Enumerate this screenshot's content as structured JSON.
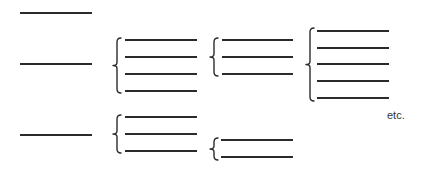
{
  "diagram": {
    "colors": {
      "line": "#2b2b2b",
      "background": "#ffffff",
      "text": "#333333"
    },
    "singles": [
      {
        "id": "single-1",
        "x1": 20,
        "x2": 92,
        "y": 13
      },
      {
        "id": "single-2",
        "x1": 20,
        "x2": 92,
        "y": 64
      },
      {
        "id": "single-3",
        "x1": 20,
        "x2": 92,
        "y": 135
      }
    ],
    "groups": [
      {
        "id": "group-a",
        "count": 4,
        "x1": 125,
        "x2": 197,
        "ys": [
          40,
          57,
          74,
          91
        ],
        "brace": {
          "x": 117,
          "y1": 38,
          "y2": 93
        }
      },
      {
        "id": "group-b",
        "count": 3,
        "x1": 125,
        "x2": 197,
        "ys": [
          117,
          134,
          151
        ],
        "brace": {
          "x": 117,
          "y1": 115,
          "y2": 153
        }
      },
      {
        "id": "group-c",
        "count": 3,
        "x1": 222,
        "x2": 293,
        "ys": [
          40,
          57,
          74
        ],
        "brace": {
          "x": 214,
          "y1": 38,
          "y2": 76
        }
      },
      {
        "id": "group-d",
        "count": 5,
        "x1": 317,
        "x2": 389,
        "ys": [
          31,
          48,
          64,
          81,
          98
        ],
        "brace": {
          "x": 310,
          "y1": 28,
          "y2": 101
        }
      },
      {
        "id": "group-e",
        "count": 2,
        "x1": 221,
        "x2": 293,
        "ys": [
          140,
          157
        ],
        "brace": {
          "x": 214,
          "y1": 138,
          "y2": 160
        }
      }
    ],
    "annotation": {
      "text": "etc.",
      "x": 387,
      "y": 109
    }
  }
}
